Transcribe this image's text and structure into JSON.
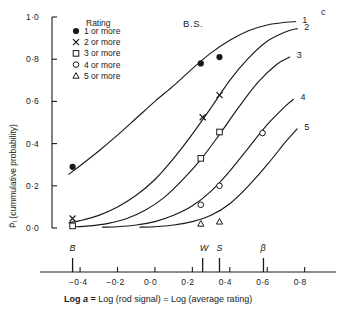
{
  "figure": {
    "observer_label": "B.S.",
    "axis_caption_html": "<b>Log </b><i>a</i> <b>=</b> Log (rod signal) = Log (average rating)",
    "y_axis_label": "P̄ᵢ (cummulative probability)",
    "curve_group_label": "c"
  },
  "legend": {
    "title": "Rating",
    "items": [
      {
        "marker": "filled-circle-marker",
        "label": "1 or more"
      },
      {
        "marker": "cross-marker",
        "label": "2 or more"
      },
      {
        "marker": "square-marker",
        "label": "3 or more"
      },
      {
        "marker": "open-circle-marker",
        "label": "4 or more"
      },
      {
        "marker": "triangle-marker",
        "label": "5 or more"
      }
    ]
  },
  "curve_labels": [
    "1",
    "2",
    "3",
    "4",
    "5"
  ],
  "x_axis_markers": [
    {
      "name": "B",
      "value": -0.44
    },
    {
      "name": "W",
      "value": 0.255
    },
    {
      "name": "S",
      "value": 0.345
    },
    {
      "name": "β",
      "value": 0.58
    }
  ],
  "chart_data": {
    "type": "line",
    "title": "B.S.",
    "xlabel": "Log a = Log (rod signal) = Log (average rating)",
    "ylabel": "P̄ᵢ (cummulative probability)",
    "xlim": [
      -0.55,
      0.85
    ],
    "ylim": [
      0.0,
      1.0
    ],
    "xticks": [
      -0.4,
      -0.2,
      0.0,
      0.2,
      0.4,
      0.6,
      0.8
    ],
    "xticklabels": [
      "−0·4",
      "−0·2",
      "0·0",
      "0·2",
      "0·4",
      "0·6",
      "0·8"
    ],
    "yticks": [
      0.0,
      0.2,
      0.4,
      0.6,
      0.8,
      1.0
    ],
    "yticklabels": [
      "0·0",
      "0·2",
      "0·4",
      "0·6",
      "0·8",
      "1·0"
    ],
    "grid": false,
    "legend_position": "top-left",
    "series": [
      {
        "name": "1 or more",
        "curve_label": "1",
        "marker": "filled-circle-marker",
        "fit_x": [
          -0.46,
          -0.4,
          -0.3,
          -0.2,
          -0.1,
          0.0,
          0.1,
          0.2,
          0.3,
          0.4,
          0.5,
          0.6,
          0.7,
          0.75
        ],
        "fit_y": [
          0.255,
          0.295,
          0.365,
          0.44,
          0.52,
          0.6,
          0.675,
          0.755,
          0.83,
          0.89,
          0.935,
          0.962,
          0.975,
          0.978
        ],
        "points": [
          {
            "x": -0.44,
            "y": 0.29
          },
          {
            "x": 0.245,
            "y": 0.78
          },
          {
            "x": 0.345,
            "y": 0.81
          }
        ]
      },
      {
        "name": "2 or more",
        "curve_label": "2",
        "marker": "cross-marker",
        "fit_x": [
          -0.46,
          -0.4,
          -0.3,
          -0.2,
          -0.1,
          0.0,
          0.1,
          0.2,
          0.3,
          0.4,
          0.5,
          0.6,
          0.7,
          0.76
        ],
        "fit_y": [
          0.025,
          0.035,
          0.06,
          0.1,
          0.155,
          0.23,
          0.33,
          0.445,
          0.57,
          0.7,
          0.805,
          0.885,
          0.93,
          0.945
        ],
        "points": [
          {
            "x": -0.44,
            "y": 0.045
          },
          {
            "x": 0.255,
            "y": 0.525
          },
          {
            "x": 0.345,
            "y": 0.63
          }
        ]
      },
      {
        "name": "3 or more",
        "curve_label": "3",
        "marker": "square-marker",
        "fit_x": [
          -0.44,
          -0.35,
          -0.25,
          -0.15,
          -0.05,
          0.05,
          0.15,
          0.25,
          0.35,
          0.45,
          0.55,
          0.65,
          0.72
        ],
        "fit_y": [
          0.005,
          0.01,
          0.022,
          0.045,
          0.085,
          0.145,
          0.23,
          0.33,
          0.45,
          0.575,
          0.69,
          0.775,
          0.81
        ],
        "points": [
          {
            "x": -0.44,
            "y": 0.01
          },
          {
            "x": 0.245,
            "y": 0.33
          },
          {
            "x": 0.345,
            "y": 0.455
          }
        ]
      },
      {
        "name": "4 or more",
        "curve_label": "4",
        "marker": "open-circle-marker",
        "fit_x": [
          -0.28,
          -0.2,
          -0.1,
          0.0,
          0.1,
          0.2,
          0.3,
          0.4,
          0.5,
          0.6,
          0.7,
          0.74
        ],
        "fit_y": [
          0.004,
          0.006,
          0.014,
          0.03,
          0.06,
          0.105,
          0.175,
          0.27,
          0.38,
          0.49,
          0.58,
          0.61
        ],
        "points": [
          {
            "x": 0.245,
            "y": 0.11
          },
          {
            "x": 0.345,
            "y": 0.2
          },
          {
            "x": 0.575,
            "y": 0.45
          }
        ]
      },
      {
        "name": "5 or more",
        "curve_label": "5",
        "marker": "triangle-marker",
        "fit_x": [
          -0.08,
          0.0,
          0.1,
          0.2,
          0.3,
          0.4,
          0.5,
          0.6,
          0.7,
          0.76
        ],
        "fit_y": [
          0.004,
          0.006,
          0.014,
          0.03,
          0.06,
          0.115,
          0.2,
          0.3,
          0.41,
          0.47
        ],
        "points": [
          {
            "x": 0.245,
            "y": 0.02
          },
          {
            "x": 0.345,
            "y": 0.03
          }
        ]
      }
    ]
  }
}
